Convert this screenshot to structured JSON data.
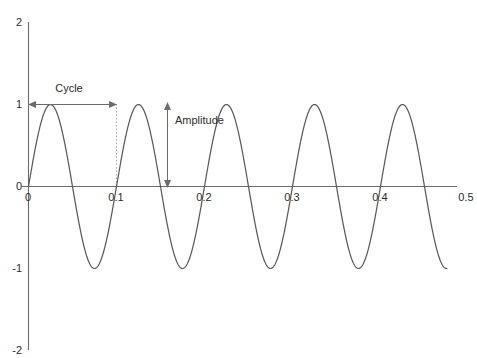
{
  "figure": {
    "width": 477,
    "height": 358,
    "background": "#ffffff",
    "line_color": "#5a5a5a",
    "axis_color": "#6b6b6b",
    "text_color": "#2b2b2b",
    "guide_color": "#a8a8a8"
  },
  "chart_data": {
    "type": "line",
    "title": "",
    "subtitle": "",
    "xlabel": "",
    "ylabel": "",
    "xlim": [
      0,
      0.5
    ],
    "ylim": [
      -2,
      2
    ],
    "grid": false,
    "legend": "none",
    "x_ticks": [
      0,
      0.1,
      0.2,
      0.3,
      0.4,
      0.5
    ],
    "x_tick_labels": [
      "0",
      "0.1",
      "0.2",
      "0.3",
      "0.4",
      "0.5"
    ],
    "y_ticks": [
      2,
      1,
      0,
      -1,
      -2
    ],
    "y_tick_labels": [
      "2",
      "1",
      "0",
      "-1",
      "-2"
    ],
    "series": [
      {
        "name": "sine-wave",
        "kind": "sine",
        "amplitude": 1,
        "period": 0.1,
        "frequency_hz": 10,
        "phase": 0,
        "x_start": 0,
        "x_end": 0.4755,
        "color": "#5a5a5a"
      }
    ],
    "annotations": [
      {
        "name": "cycle",
        "label": "Cycle",
        "kind": "double-arrow-horizontal",
        "y": 1,
        "x_from": 0,
        "x_to": 0.1,
        "label_x": 0.0465,
        "label_y": 1.18
      },
      {
        "name": "amplitude",
        "label": "Amplitude",
        "kind": "double-arrow-vertical",
        "x": 0.158,
        "y_from": 0,
        "y_to": 1,
        "label_x": 0.172,
        "label_y": 0.68
      },
      {
        "name": "cycle-end-guide",
        "label": "",
        "kind": "dotted-vertical",
        "x": 0.1,
        "y_from": 0,
        "y_to": 1
      }
    ]
  },
  "axis_labels": {
    "y": {
      "top": "2",
      "upper": "1",
      "zero": "0",
      "lower": "-1",
      "bottom": "-2"
    },
    "x": {
      "t0": "0",
      "t1": "0.1",
      "t2": "0.2",
      "t3": "0.3",
      "t4": "0.4",
      "t5": "0.5"
    }
  },
  "annotation_labels": {
    "cycle": "Cycle",
    "amplitude": "Amplitude"
  }
}
